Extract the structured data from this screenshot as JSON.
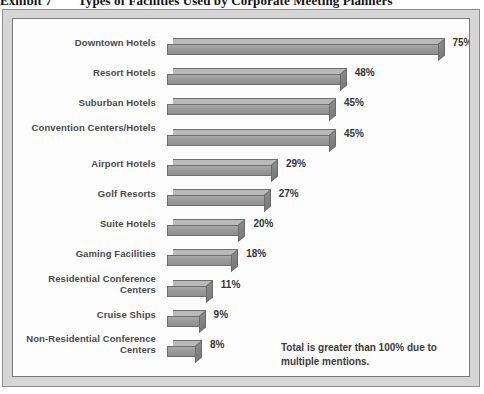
{
  "exhibit": {
    "number": "Exhibit 7",
    "title": "Types of Facilities Used by Corporate Meeting Planners"
  },
  "note": "Total is greater than 100% due to multiple mentions.",
  "chart_data": {
    "type": "bar",
    "orientation": "horizontal",
    "title": "Types of Facilities Used by Corporate Meeting Planners",
    "xlabel": "",
    "ylabel": "",
    "xlim": [
      0,
      80
    ],
    "grid": false,
    "legend": "none",
    "value_suffix": "%",
    "annotations": [
      "Total is greater than 100% due to multiple mentions."
    ],
    "categories": [
      "Downtown Hotels",
      "Resort Hotels",
      "Suburban Hotels",
      "Convention Centers/Hotels",
      "Airport Hotels",
      "Golf Resorts",
      "Suite Hotels",
      "Gaming Facilities",
      "Residential Conference Centers",
      "Cruise Ships",
      "Non-Residential Conference Centers"
    ],
    "values": [
      75,
      48,
      45,
      45,
      29,
      27,
      20,
      18,
      11,
      9,
      8
    ],
    "value_labels": [
      "75%",
      "48%",
      "45%",
      "45%",
      "29%",
      "27%",
      "20%",
      "18%",
      "11%",
      "9%",
      "8%"
    ],
    "colors": {
      "bar_front": "#9a9a9a",
      "bar_top": "#bdbdbd",
      "bar_side": "#7e7e7e",
      "bar_outline": "#6e6e6e",
      "label_text": "#4a4a4a",
      "frame": "#d6d6d6",
      "plot_background": "#fdfdfd"
    }
  }
}
